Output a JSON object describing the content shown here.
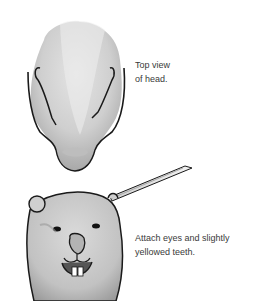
{
  "illustration": {
    "top_step": {
      "subject": "top-view-of-beaver-head",
      "caption_lines": [
        "Top view",
        "of head."
      ]
    },
    "bottom_step": {
      "subject": "front-view-of-beaver-head-with-brush",
      "caption_lines": [
        "Attach eyes and slightly",
        "yellowed teeth."
      ]
    }
  },
  "colors": {
    "background": "#ffffff",
    "fur_light": "#d6d6d6",
    "fur_dark": "#9a9a9a",
    "outline": "#1a1a1a",
    "text": "#3a3a3a"
  }
}
